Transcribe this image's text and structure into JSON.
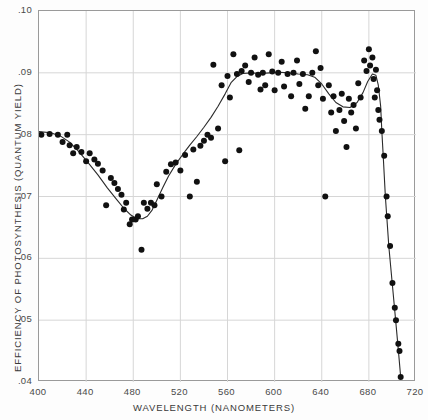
{
  "chart_data": {
    "type": "scatter",
    "title": "",
    "xlabel": "WAVELENGTH (NANOMETERS)",
    "ylabel": "EFFICIENCY OF PHOTOSYNTHESIS (QUANTUM YIELD)",
    "xlim": [
      400,
      720
    ],
    "ylim": [
      0.04,
      0.1
    ],
    "xticks": [
      400,
      440,
      480,
      520,
      560,
      600,
      640,
      680,
      720
    ],
    "xtick_labels": [
      "400",
      "440",
      "480",
      "520",
      "560",
      "600",
      "640",
      "680",
      "720"
    ],
    "yticks": [
      0.04,
      0.05,
      0.06,
      0.07,
      0.08,
      0.09,
      0.1
    ],
    "ytick_labels": [
      ".04",
      ".05",
      ".06",
      ".07",
      ".08",
      ".09",
      ".10"
    ],
    "grid": true,
    "grid_color": "#d6d6d6",
    "legend": null,
    "marker_color": "#111111",
    "marker_size": 3.0,
    "line_color": "#2b2b2b",
    "line_width": 1.1,
    "series": [
      {
        "name": "measured quantum yield",
        "type": "scatter",
        "points": [
          [
            402,
            0.08
          ],
          [
            409,
            0.0801
          ],
          [
            416,
            0.08
          ],
          [
            420,
            0.0788
          ],
          [
            424,
            0.08
          ],
          [
            426,
            0.0783
          ],
          [
            429,
            0.077
          ],
          [
            432,
            0.078
          ],
          [
            436,
            0.0772
          ],
          [
            440,
            0.0757
          ],
          [
            443,
            0.077
          ],
          [
            447,
            0.076
          ],
          [
            450,
            0.0753
          ],
          [
            454,
            0.0742
          ],
          [
            457,
            0.0686
          ],
          [
            461,
            0.073
          ],
          [
            464,
            0.0722
          ],
          [
            467,
            0.0712
          ],
          [
            470,
            0.0703
          ],
          [
            472,
            0.0679
          ],
          [
            474,
            0.069
          ],
          [
            477,
            0.0655
          ],
          [
            479,
            0.0663
          ],
          [
            482,
            0.0663
          ],
          [
            484,
            0.0668
          ],
          [
            487,
            0.0614
          ],
          [
            489,
            0.069
          ],
          [
            492,
            0.068
          ],
          [
            495,
            0.069
          ],
          [
            498,
            0.0686
          ],
          [
            500,
            0.072
          ],
          [
            504,
            0.07
          ],
          [
            508,
            0.074
          ],
          [
            512,
            0.0752
          ],
          [
            516,
            0.0755
          ],
          [
            520,
            0.0742
          ],
          [
            524,
            0.0767
          ],
          [
            528,
            0.07
          ],
          [
            531,
            0.0776
          ],
          [
            534,
            0.0724
          ],
          [
            537,
            0.0782
          ],
          [
            540,
            0.079
          ],
          [
            543,
            0.08
          ],
          [
            546,
            0.0795
          ],
          [
            548,
            0.0913
          ],
          [
            552,
            0.081
          ],
          [
            555,
            0.088
          ],
          [
            558,
            0.0757
          ],
          [
            560,
            0.0895
          ],
          [
            562,
            0.086
          ],
          [
            565,
            0.093
          ],
          [
            568,
            0.0898
          ],
          [
            570,
            0.0775
          ],
          [
            572,
            0.0903
          ],
          [
            575,
            0.0912
          ],
          [
            578,
            0.0885
          ],
          [
            580,
            0.09
          ],
          [
            583,
            0.0925
          ],
          [
            586,
            0.0897
          ],
          [
            588,
            0.0873
          ],
          [
            590,
            0.09
          ],
          [
            592,
            0.088
          ],
          [
            595,
            0.093
          ],
          [
            598,
            0.0902
          ],
          [
            600,
            0.0872
          ],
          [
            603,
            0.09
          ],
          [
            606,
            0.0918
          ],
          [
            608,
            0.0878
          ],
          [
            611,
            0.0898
          ],
          [
            614,
            0.0862
          ],
          [
            616,
            0.09
          ],
          [
            619,
            0.092
          ],
          [
            621,
            0.0882
          ],
          [
            624,
            0.0898
          ],
          [
            626,
            0.0842
          ],
          [
            629,
            0.0862
          ],
          [
            632,
            0.09
          ],
          [
            635,
            0.0935
          ],
          [
            637,
            0.088
          ],
          [
            639,
            0.0908
          ],
          [
            641,
            0.0858
          ],
          [
            643,
            0.07
          ],
          [
            646,
            0.088
          ],
          [
            648,
            0.0836
          ],
          [
            650,
            0.0862
          ],
          [
            652,
            0.0806
          ],
          [
            655,
            0.084
          ],
          [
            657,
            0.0866
          ],
          [
            659,
            0.0822
          ],
          [
            661,
            0.078
          ],
          [
            663,
            0.0858
          ],
          [
            665,
            0.0836
          ],
          [
            667,
            0.0848
          ],
          [
            669,
            0.081
          ],
          [
            671,
            0.0883
          ],
          [
            673,
            0.086
          ],
          [
            676,
            0.092
          ],
          [
            678,
            0.0903
          ],
          [
            680,
            0.0938
          ],
          [
            681,
            0.0912
          ],
          [
            683,
            0.0925
          ],
          [
            684,
            0.089
          ],
          [
            685,
            0.086
          ],
          [
            686,
            0.0905
          ],
          [
            687,
            0.0872
          ],
          [
            688,
            0.084
          ],
          [
            689,
            0.0824
          ],
          [
            691,
            0.0806
          ],
          [
            693,
            0.0766
          ],
          [
            695,
            0.07
          ],
          [
            696,
            0.0668
          ],
          [
            698,
            0.062
          ],
          [
            700,
            0.056
          ],
          [
            702,
            0.052
          ],
          [
            703,
            0.05
          ],
          [
            705,
            0.0462
          ],
          [
            706,
            0.045
          ],
          [
            707,
            0.0408
          ]
        ]
      },
      {
        "name": "fitted action spectrum curve",
        "type": "line",
        "points": [
          [
            400,
            0.0805
          ],
          [
            410,
            0.0803
          ],
          [
            418,
            0.0798
          ],
          [
            426,
            0.0788
          ],
          [
            434,
            0.0772
          ],
          [
            442,
            0.0754
          ],
          [
            450,
            0.0735
          ],
          [
            458,
            0.0714
          ],
          [
            466,
            0.0695
          ],
          [
            472,
            0.0681
          ],
          [
            478,
            0.067
          ],
          [
            483,
            0.0664
          ],
          [
            488,
            0.0664
          ],
          [
            492,
            0.0668
          ],
          [
            496,
            0.0678
          ],
          [
            500,
            0.0694
          ],
          [
            505,
            0.0714
          ],
          [
            510,
            0.0733
          ],
          [
            516,
            0.0752
          ],
          [
            522,
            0.0768
          ],
          [
            528,
            0.0783
          ],
          [
            534,
            0.0797
          ],
          [
            540,
            0.0812
          ],
          [
            546,
            0.0828
          ],
          [
            552,
            0.0846
          ],
          [
            558,
            0.0866
          ],
          [
            563,
            0.0884
          ],
          [
            568,
            0.0894
          ],
          [
            573,
            0.0899
          ],
          [
            580,
            0.09
          ],
          [
            588,
            0.0899
          ],
          [
            596,
            0.09
          ],
          [
            604,
            0.0901
          ],
          [
            612,
            0.09
          ],
          [
            620,
            0.0898
          ],
          [
            628,
            0.0897
          ],
          [
            634,
            0.0893
          ],
          [
            640,
            0.0882
          ],
          [
            646,
            0.0866
          ],
          [
            652,
            0.0852
          ],
          [
            658,
            0.0845
          ],
          [
            664,
            0.0844
          ],
          [
            670,
            0.0852
          ],
          [
            675,
            0.0868
          ],
          [
            679,
            0.0886
          ],
          [
            683,
            0.0898
          ],
          [
            686,
            0.0896
          ],
          [
            688,
            0.088
          ],
          [
            690,
            0.0846
          ],
          [
            691,
            0.0806
          ],
          [
            692,
            0.0772
          ],
          [
            694,
            0.07
          ],
          [
            697,
            0.0618
          ],
          [
            700,
            0.0556
          ],
          [
            703,
            0.0494
          ],
          [
            705,
            0.0452
          ],
          [
            707,
            0.0408
          ]
        ]
      }
    ]
  }
}
